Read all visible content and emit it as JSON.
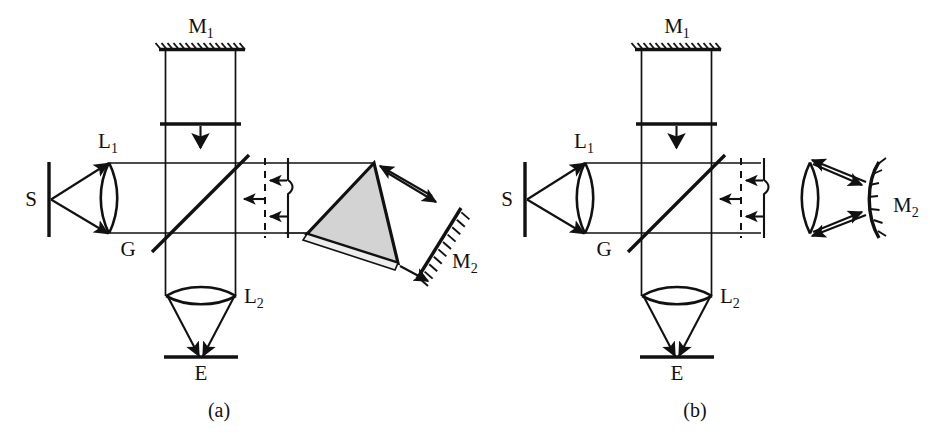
{
  "figure": {
    "background_color": "#ffffff",
    "stroke_color": "#111111",
    "prism_fill_color": "#d3d3d3",
    "prism_strip_color": "#ededed"
  },
  "panels": [
    {
      "id": "a",
      "caption": "(a)",
      "description": "Michelson interferometer with a right-angle prism retroreflector and a plane mirror M2",
      "labels": {
        "source": "S",
        "lens1_base": "L",
        "lens1_sub": "1",
        "beamsplitter": "G",
        "mirror1_base": "M",
        "mirror1_sub": "1",
        "mirror2_base": "M",
        "mirror2_sub": "2",
        "lens2_base": "L",
        "lens2_sub": "2",
        "screen": "E"
      },
      "components": [
        "source-slit",
        "collimating-lens-L1",
        "beamsplitter-G",
        "plane-mirror-M1",
        "aperture-stop",
        "dashed-reference-plane",
        "prism-retroreflector",
        "plane-mirror-M2",
        "imaging-lens-L2",
        "screen-E"
      ]
    },
    {
      "id": "b",
      "caption": "(b)",
      "description": "Michelson interferometer with a lens and a concave spherical mirror M2",
      "labels": {
        "source": "S",
        "lens1_base": "L",
        "lens1_sub": "1",
        "beamsplitter": "G",
        "mirror1_base": "M",
        "mirror1_sub": "1",
        "mirror2_base": "M",
        "mirror2_sub": "2",
        "lens2_base": "L",
        "lens2_sub": "2",
        "screen": "E"
      },
      "components": [
        "source-slit",
        "collimating-lens-L1",
        "beamsplitter-G",
        "plane-mirror-M1",
        "aperture-stop",
        "dashed-reference-plane",
        "focusing-lens",
        "concave-mirror-M2",
        "imaging-lens-L2",
        "screen-E"
      ]
    }
  ]
}
